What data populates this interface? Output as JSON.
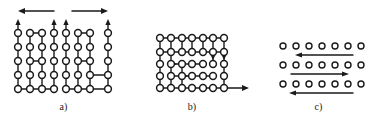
{
  "figure": {
    "background_color": "#ffffff",
    "stroke_color": "#1a1a1a",
    "atom_fill_color": "#ffffff"
  },
  "panels": [
    {
      "id": "a",
      "caption": "a)",
      "description": "Lattice of atoms in vertical chains with shear arrows above",
      "grid": {
        "columns": 8,
        "rows": 5,
        "atom_radius": 3.4
      },
      "top_arrows": [
        {
          "name": "shear-arrow-left",
          "direction": "left",
          "x_start": 54,
          "x_end": 20,
          "y": 11
        },
        {
          "name": "shear-arrow-right",
          "direction": "right",
          "x_start": 72,
          "x_end": 108,
          "y": 11
        }
      ],
      "column_up_arrows": [
        1,
        4,
        5,
        8
      ],
      "horizontal_bonds": [
        {
          "row": 1,
          "from_col": 2,
          "to_col": 3
        },
        {
          "row": 1,
          "from_col": 6,
          "to_col": 7
        },
        {
          "row": 5,
          "from_col": 1,
          "to_col": 2
        },
        {
          "row": 5,
          "from_col": 2,
          "to_col": 3
        },
        {
          "row": 5,
          "from_col": 3,
          "to_col": 4
        },
        {
          "row": 5,
          "from_col": 5,
          "to_col": 6
        },
        {
          "row": 5,
          "from_col": 6,
          "to_col": 7
        },
        {
          "row": 5,
          "from_col": 7,
          "to_col": 8
        }
      ]
    },
    {
      "id": "b",
      "caption": "b)",
      "description": "Lattice with edge dislocation and rightward glide arrow",
      "grid": {
        "columns": 7,
        "rows": 5,
        "atom_radius": 3.4
      },
      "glide_arrow": {
        "name": "glide-arrow-right",
        "direction": "right",
        "x_start": 97,
        "x_end": 122,
        "y": 86
      },
      "internal_arrows": [
        {
          "name": "internal-arrow-right-1",
          "direction": "right",
          "row": 3,
          "col": 3
        },
        {
          "name": "internal-arrow-right-2",
          "direction": "right",
          "row": 4,
          "col": 3
        },
        {
          "name": "internal-arrow-down-1",
          "direction": "down",
          "row": 3,
          "col": 6
        },
        {
          "name": "internal-arrow-down-2",
          "direction": "down",
          "row": 3,
          "col": 7
        }
      ]
    },
    {
      "id": "c",
      "caption": "c)",
      "description": "Three rows of free atoms with alternating directional arrows",
      "rows": [
        {
          "index": 1,
          "atom_count": 7
        },
        {
          "index": 2,
          "atom_count": 7
        },
        {
          "index": 3,
          "atom_count": 7
        }
      ],
      "arrows": [
        {
          "name": "row-arrow-left-top",
          "direction": "left",
          "y": 54
        },
        {
          "name": "row-arrow-right-middle",
          "direction": "right",
          "y": 73
        },
        {
          "name": "row-arrow-left-bottom",
          "direction": "left",
          "y": 92
        }
      ],
      "atom_radius": 3.0
    }
  ]
}
